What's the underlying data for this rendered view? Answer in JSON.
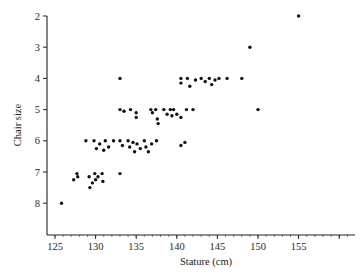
{
  "chart_data": {
    "type": "scatter",
    "title": "",
    "xlabel": "Stature (cm)",
    "ylabel": "Chair size",
    "xlim": [
      124,
      161
    ],
    "ylim": [
      9.0,
      2.0
    ],
    "y_inverted": true,
    "grid": false,
    "legend": null,
    "x_ticks": [
      125,
      130,
      135,
      140,
      145,
      150,
      155
    ],
    "x_minor_step": 1,
    "x_extra_tick": 160,
    "y_ticks": [
      2,
      3,
      4,
      5,
      6,
      7,
      8
    ],
    "series": [
      {
        "name": "children",
        "points": [
          {
            "x": 155.0,
            "y": 2.0
          },
          {
            "x": 149.0,
            "y": 3.0
          },
          {
            "x": 133.0,
            "y": 4.0
          },
          {
            "x": 140.5,
            "y": 4.0
          },
          {
            "x": 140.5,
            "y": 4.15
          },
          {
            "x": 141.3,
            "y": 4.0
          },
          {
            "x": 141.6,
            "y": 4.25
          },
          {
            "x": 142.3,
            "y": 4.05
          },
          {
            "x": 143.0,
            "y": 4.0
          },
          {
            "x": 143.5,
            "y": 4.1
          },
          {
            "x": 144.0,
            "y": 4.0
          },
          {
            "x": 144.3,
            "y": 4.2
          },
          {
            "x": 144.7,
            "y": 4.05
          },
          {
            "x": 145.2,
            "y": 4.0
          },
          {
            "x": 146.2,
            "y": 4.0
          },
          {
            "x": 148.0,
            "y": 4.0
          },
          {
            "x": 133.0,
            "y": 5.0
          },
          {
            "x": 133.5,
            "y": 5.05
          },
          {
            "x": 134.3,
            "y": 5.0
          },
          {
            "x": 135.0,
            "y": 5.1
          },
          {
            "x": 135.0,
            "y": 5.25
          },
          {
            "x": 136.8,
            "y": 5.0
          },
          {
            "x": 137.0,
            "y": 5.1
          },
          {
            "x": 137.4,
            "y": 5.0
          },
          {
            "x": 137.6,
            "y": 5.3
          },
          {
            "x": 137.7,
            "y": 5.45
          },
          {
            "x": 138.4,
            "y": 5.0
          },
          {
            "x": 138.8,
            "y": 5.15
          },
          {
            "x": 139.2,
            "y": 5.0
          },
          {
            "x": 139.4,
            "y": 5.2
          },
          {
            "x": 139.6,
            "y": 5.0
          },
          {
            "x": 140.0,
            "y": 5.15
          },
          {
            "x": 140.5,
            "y": 5.25
          },
          {
            "x": 141.2,
            "y": 5.0
          },
          {
            "x": 142.0,
            "y": 5.0
          },
          {
            "x": 150.0,
            "y": 5.0
          },
          {
            "x": 128.8,
            "y": 6.0
          },
          {
            "x": 129.8,
            "y": 6.0
          },
          {
            "x": 130.1,
            "y": 6.25
          },
          {
            "x": 130.5,
            "y": 6.1
          },
          {
            "x": 131.0,
            "y": 6.3
          },
          {
            "x": 131.2,
            "y": 6.0
          },
          {
            "x": 131.6,
            "y": 6.2
          },
          {
            "x": 132.2,
            "y": 6.0
          },
          {
            "x": 133.0,
            "y": 6.0
          },
          {
            "x": 133.3,
            "y": 6.15
          },
          {
            "x": 134.0,
            "y": 6.0
          },
          {
            "x": 134.2,
            "y": 6.2
          },
          {
            "x": 134.6,
            "y": 6.05
          },
          {
            "x": 134.8,
            "y": 6.35
          },
          {
            "x": 135.1,
            "y": 6.1
          },
          {
            "x": 135.5,
            "y": 6.25
          },
          {
            "x": 136.0,
            "y": 6.0
          },
          {
            "x": 136.2,
            "y": 6.2
          },
          {
            "x": 136.5,
            "y": 6.35
          },
          {
            "x": 136.9,
            "y": 6.1
          },
          {
            "x": 137.5,
            "y": 6.0
          },
          {
            "x": 140.5,
            "y": 6.15
          },
          {
            "x": 141.0,
            "y": 6.05
          },
          {
            "x": 127.3,
            "y": 7.25
          },
          {
            "x": 127.7,
            "y": 7.05
          },
          {
            "x": 127.8,
            "y": 7.15
          },
          {
            "x": 129.2,
            "y": 7.15
          },
          {
            "x": 129.3,
            "y": 7.5
          },
          {
            "x": 129.6,
            "y": 7.35
          },
          {
            "x": 129.9,
            "y": 7.05
          },
          {
            "x": 130.0,
            "y": 7.25
          },
          {
            "x": 130.3,
            "y": 7.15
          },
          {
            "x": 130.8,
            "y": 7.05
          },
          {
            "x": 130.9,
            "y": 7.3
          },
          {
            "x": 133.0,
            "y": 7.05
          },
          {
            "x": 125.8,
            "y": 8.0
          }
        ]
      }
    ]
  }
}
